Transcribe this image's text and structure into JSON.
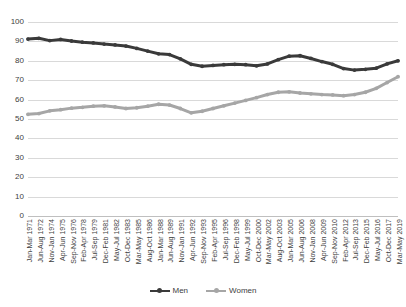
{
  "chart_data": {
    "type": "line",
    "title": "",
    "xlabel": "",
    "ylabel": "",
    "ylim": [
      0,
      100
    ],
    "ytick_step": 10,
    "grid": true,
    "legend_position": "bottom",
    "yticks": [
      "100",
      "90",
      "80",
      "70",
      "60",
      "50",
      "40",
      "30",
      "20",
      "10",
      "0"
    ],
    "categories": [
      "Jan-Mar 1971",
      "Jun-Aug 1972",
      "Nov-Jan 1974",
      "Apr-Jun 1975",
      "Sep-Nov 1976",
      "Feb-Apr 1978",
      "Jul-Sep 1979",
      "Dec-Feb 1981",
      "May-Jul 1982",
      "Oct-Dec 1983",
      "Mar-May 1985",
      "Aug-Oct 1986",
      "Jan-Mar 1988",
      "Jun-Aug 1989",
      "Nov-Jan 1991",
      "Apr-Jun 1992",
      "Sep-Nov 1993",
      "Feb-Apr 1995",
      "Jul-Sep 1996",
      "Dec-Feb 1998",
      "May-Jul 1999",
      "Oct-Dec 2000",
      "Mar-May 2002",
      "Aug-Oct 2003",
      "Jan-Mar 2005",
      "Jun-Aug 2006",
      "Nov-Jan 2008",
      "Apr-Jun 2009",
      "Sep-Nov 2010",
      "Feb-Apr 2012",
      "Jul-Sep 2013",
      "Dec-Feb 2015",
      "May-Jul 2016",
      "Oct-Dec 2017",
      "Mar-May 2019"
    ],
    "series": [
      {
        "name": "Men",
        "color": "#3a3a3a",
        "values": [
          91.2,
          91.6,
          90.4,
          91.0,
          90.2,
          89.6,
          89.2,
          88.6,
          88.2,
          87.6,
          86.4,
          85.0,
          83.6,
          83.2,
          81.0,
          78.2,
          77.2,
          77.6,
          78.0,
          78.2,
          78.0,
          77.4,
          78.4,
          80.6,
          82.4,
          82.6,
          81.2,
          79.6,
          78.2,
          76.0,
          75.2,
          75.6,
          76.2,
          78.4,
          80.0
        ]
      },
      {
        "name": "Women",
        "color": "#a6a6a6",
        "values": [
          52.4,
          52.8,
          54.2,
          54.8,
          55.6,
          56.0,
          56.6,
          56.8,
          56.2,
          55.4,
          55.8,
          56.6,
          57.6,
          57.2,
          55.4,
          53.2,
          54.0,
          55.4,
          56.8,
          58.2,
          59.6,
          61.0,
          62.6,
          63.8,
          64.0,
          63.4,
          63.0,
          62.6,
          62.4,
          62.0,
          62.6,
          63.8,
          65.8,
          68.8,
          71.8
        ]
      }
    ]
  },
  "legend": {
    "items": [
      {
        "label": "Men",
        "color": "#3a3a3a"
      },
      {
        "label": "Women",
        "color": "#a6a6a6"
      }
    ]
  }
}
